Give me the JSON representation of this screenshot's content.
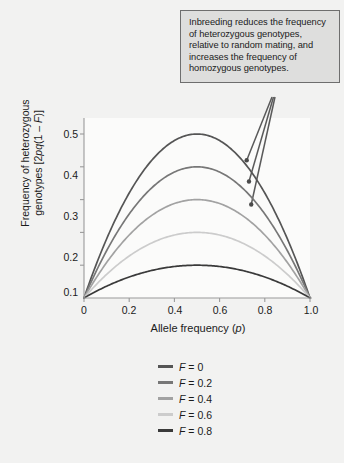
{
  "annotation": {
    "text": "Inbreeding reduces the frequency of heterozygous genotypes, relative to random mating, and increases the frequency of homozygous genotypes."
  },
  "axes": {
    "x_title_main": "Allele frequency (",
    "x_title_var": "p",
    "x_title_end": ")",
    "y_title_line1": "Frequency of heterozygous",
    "y_title_line2_pre": "genotypes [2",
    "y_title_line2_var": "pq",
    "y_title_line2_mid": "(1 – ",
    "y_title_line2_var2": "F",
    "y_title_line2_end": ")]"
  },
  "ticks": {
    "x": [
      "0",
      "0.2",
      "0.4",
      "0.6",
      "0.8",
      "1.0"
    ],
    "y": [
      "0.1",
      "0.2",
      "0.3",
      "0.4",
      "0.5"
    ]
  },
  "legend": {
    "items": [
      {
        "label_var": "F",
        "label_rest": " = 0",
        "color": "#555555"
      },
      {
        "label_var": "F",
        "label_rest": " = 0.2",
        "color": "#777777"
      },
      {
        "label_var": "F",
        "label_rest": " = 0.4",
        "color": "#a2a2a2"
      },
      {
        "label_var": "F",
        "label_rest": " = 0.6",
        "color": "#cccccc"
      },
      {
        "label_var": "F",
        "label_rest": " = 0.8",
        "color": "#3a3a3a"
      }
    ]
  },
  "chart_data": {
    "type": "line",
    "title": "",
    "xlabel": "Allele frequency (p)",
    "ylabel": "Frequency of heterozygous genotypes [2pq(1 - F)]",
    "xlim": [
      0,
      1.0
    ],
    "ylim": [
      0,
      0.55
    ],
    "xticks": [
      0,
      0.2,
      0.4,
      0.6,
      0.8,
      1.0
    ],
    "yticks": [
      0.1,
      0.2,
      0.3,
      0.4,
      0.5
    ],
    "grid": false,
    "legend_position": "below",
    "formula": "2pq(1 - F)",
    "x": [
      0,
      0.05,
      0.1,
      0.15,
      0.2,
      0.25,
      0.3,
      0.35,
      0.4,
      0.45,
      0.5,
      0.55,
      0.6,
      0.65,
      0.7,
      0.75,
      0.8,
      0.85,
      0.9,
      0.95,
      1.0
    ],
    "series": [
      {
        "name": "F = 0",
        "F": 0,
        "color": "#555555",
        "peak": 0.5,
        "values": [
          0,
          0.095,
          0.18,
          0.255,
          0.32,
          0.375,
          0.42,
          0.455,
          0.48,
          0.495,
          0.5,
          0.495,
          0.48,
          0.455,
          0.42,
          0.375,
          0.32,
          0.255,
          0.18,
          0.095,
          0
        ]
      },
      {
        "name": "F = 0.2",
        "F": 0.2,
        "color": "#777777",
        "peak": 0.4,
        "values": [
          0,
          0.076,
          0.144,
          0.204,
          0.256,
          0.3,
          0.336,
          0.364,
          0.384,
          0.396,
          0.4,
          0.396,
          0.384,
          0.364,
          0.336,
          0.3,
          0.256,
          0.204,
          0.144,
          0.076,
          0
        ]
      },
      {
        "name": "F = 0.4",
        "F": 0.4,
        "color": "#a2a2a2",
        "peak": 0.3,
        "values": [
          0,
          0.057,
          0.108,
          0.153,
          0.192,
          0.225,
          0.252,
          0.273,
          0.288,
          0.297,
          0.3,
          0.297,
          0.288,
          0.273,
          0.252,
          0.225,
          0.192,
          0.153,
          0.108,
          0.057,
          0
        ]
      },
      {
        "name": "F = 0.6",
        "F": 0.6,
        "color": "#cccccc",
        "peak": 0.2,
        "values": [
          0,
          0.038,
          0.072,
          0.102,
          0.128,
          0.15,
          0.168,
          0.182,
          0.192,
          0.198,
          0.2,
          0.198,
          0.192,
          0.182,
          0.168,
          0.15,
          0.128,
          0.102,
          0.072,
          0.038,
          0
        ]
      },
      {
        "name": "F = 0.8",
        "F": 0.8,
        "color": "#3a3a3a",
        "peak": 0.1,
        "values": [
          0,
          0.019,
          0.036,
          0.051,
          0.064,
          0.075,
          0.084,
          0.091,
          0.096,
          0.099,
          0.1,
          0.099,
          0.096,
          0.091,
          0.084,
          0.075,
          0.064,
          0.051,
          0.036,
          0.019,
          0
        ]
      }
    ],
    "annotations": [
      {
        "text": "Inbreeding reduces the frequency of heterozygous genotypes, relative to random mating, and increases the frequency of homozygous genotypes.",
        "points_to": [
          {
            "x": 0.72,
            "y": 0.42
          },
          {
            "x": 0.73,
            "y": 0.355
          },
          {
            "x": 0.74,
            "y": 0.285
          }
        ]
      }
    ]
  }
}
